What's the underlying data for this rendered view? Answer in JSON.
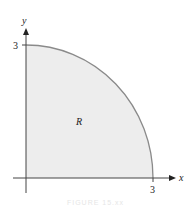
{
  "diagram": {
    "type": "region-plot",
    "axes": {
      "x_label": "x",
      "y_label": "y",
      "x_tick": "3",
      "y_tick": "3"
    },
    "region_label": "R",
    "colors": {
      "fill": "#ededed",
      "boundary": "#8a8a8a",
      "axis": "#333333"
    },
    "caption": "FIGURE 15.xx"
  }
}
